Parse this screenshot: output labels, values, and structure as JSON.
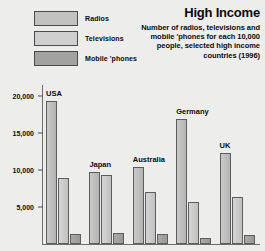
{
  "legend": {
    "items": [
      {
        "label": "Radios",
        "key": "radios",
        "color": "#c2c2c2"
      },
      {
        "label": "Televisions",
        "key": "televisions",
        "color": "#cfcfcf"
      },
      {
        "label": "Mobile 'phones",
        "key": "mobile",
        "color": "#a2a2a2"
      }
    ]
  },
  "header": {
    "title": "High Income",
    "subtitle": "Number of radios, televisions and mobile 'phones for each 10,000 people, selected high income countries (1996)"
  },
  "chart_data": {
    "type": "bar",
    "title": "High Income",
    "subtitle": "Number of radios, televisions and mobile 'phones for each 10,000 people, selected high income countries (1996)",
    "xlabel": "",
    "ylabel": "",
    "ylim": [
      0,
      21500
    ],
    "grid": false,
    "legend_position": "top-left",
    "ticks": [
      "5,000",
      "10,000",
      "15,000",
      "20,000"
    ],
    "tickvalues": [
      5000,
      10000,
      15000,
      20000
    ],
    "categories": [
      "USA",
      "Japan",
      "Australia",
      "Germany",
      "UK"
    ],
    "series": [
      {
        "name": "Radios",
        "values": [
          19300,
          9800,
          10400,
          16900,
          12300
        ]
      },
      {
        "name": "Televisions",
        "values": [
          8900,
          9300,
          7000,
          5700,
          6400
        ]
      },
      {
        "name": "Mobile 'phones",
        "values": [
          1400,
          1500,
          1300,
          800,
          1200
        ]
      }
    ]
  }
}
